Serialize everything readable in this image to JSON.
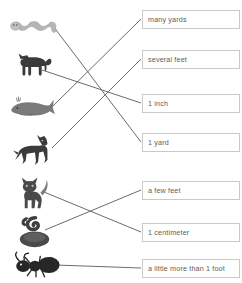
{
  "worksheet": {
    "title": "Match each animal to its approximate length",
    "width": 242,
    "height": 283,
    "background_color": "#ffffff",
    "line_color": "#6b6b6b",
    "box_border_color": "#c9c9c9",
    "text_color": "#5d5d5d"
  },
  "animals": [
    {
      "id": "worm",
      "name": "worm",
      "label": "worm",
      "x": 8,
      "y": 8,
      "w": 52,
      "h": 34,
      "connect_x": 50,
      "connect_y": 22
    },
    {
      "id": "dog",
      "name": "dog",
      "label": "dog",
      "x": 10,
      "y": 42,
      "w": 48,
      "h": 44,
      "connect_x": 42,
      "connect_y": 70
    },
    {
      "id": "whale",
      "name": "whale",
      "label": "whale",
      "x": 6,
      "y": 90,
      "w": 52,
      "h": 34,
      "connect_x": 52,
      "connect_y": 107
    },
    {
      "id": "horse",
      "name": "horse",
      "label": "horse",
      "x": 10,
      "y": 128,
      "w": 52,
      "h": 44,
      "connect_x": 52,
      "connect_y": 148
    },
    {
      "id": "cat",
      "name": "cat",
      "label": "cat",
      "x": 14,
      "y": 172,
      "w": 44,
      "h": 42,
      "connect_x": 44,
      "connect_y": 192
    },
    {
      "id": "snake",
      "name": "snake",
      "label": "snake",
      "x": 14,
      "y": 212,
      "w": 44,
      "h": 38,
      "connect_x": 45,
      "connect_y": 230
    },
    {
      "id": "ant",
      "name": "ant",
      "label": "ant",
      "x": 8,
      "y": 250,
      "w": 56,
      "h": 30,
      "connect_x": 55,
      "connect_y": 265
    }
  ],
  "labels": [
    {
      "id": "many-yards",
      "text": "many yards",
      "x": 142,
      "y": 10,
      "w": 98,
      "h": 19,
      "connect_x": 142,
      "connect_y": 19
    },
    {
      "id": "several-feet",
      "text": "several feet",
      "x": 142,
      "y": 50,
      "w": 98,
      "h": 19,
      "connect_x": 142,
      "connect_y": 59
    },
    {
      "id": "one-inch",
      "text": "1 inch",
      "x": 142,
      "y": 94,
      "w": 98,
      "h": 19,
      "connect_x": 142,
      "connect_y": 103
    },
    {
      "id": "one-yard",
      "text": "1 yard",
      "x": 142,
      "y": 133,
      "w": 98,
      "h": 19,
      "connect_x": 142,
      "connect_y": 142
    },
    {
      "id": "a-few-feet",
      "text": "a few feet",
      "x": 142,
      "y": 181,
      "w": 98,
      "h": 19,
      "connect_x": 142,
      "connect_y": 190
    },
    {
      "id": "one-cm",
      "text": "1 centimeter",
      "x": 142,
      "y": 223,
      "w": 98,
      "h": 19,
      "connect_x": 142,
      "connect_y": 232
    },
    {
      "id": "more-than-foot",
      "text": "a little more than 1 foot",
      "x": 142,
      "y": 259,
      "w": 98,
      "h": 19,
      "connect_x": 142,
      "connect_y": 268
    }
  ],
  "connections": [
    {
      "from": "worm",
      "to": "one-yard",
      "x1": 50,
      "y1": 22,
      "x2": 141,
      "y2": 142
    },
    {
      "from": "dog",
      "to": "one-inch",
      "x1": 42,
      "y1": 70,
      "x2": 141,
      "y2": 103
    },
    {
      "from": "whale",
      "to": "many-yards",
      "x1": 52,
      "y1": 107,
      "x2": 141,
      "y2": 19
    },
    {
      "from": "horse",
      "to": "several-feet",
      "x1": 52,
      "y1": 148,
      "x2": 141,
      "y2": 59
    },
    {
      "from": "cat",
      "to": "one-cm",
      "x1": 44,
      "y1": 192,
      "x2": 141,
      "y2": 232
    },
    {
      "from": "snake",
      "to": "a-few-feet",
      "x1": 45,
      "y1": 230,
      "x2": 141,
      "y2": 190
    },
    {
      "from": "ant",
      "to": "more-than-foot",
      "x1": 55,
      "y1": 265,
      "x2": 141,
      "y2": 268
    }
  ]
}
